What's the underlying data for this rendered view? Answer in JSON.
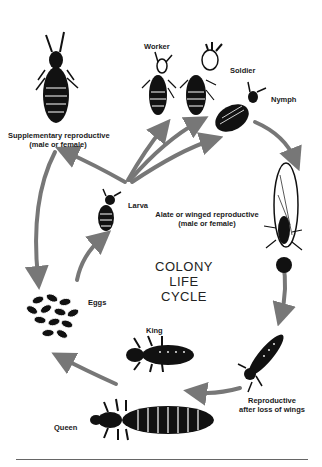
{
  "diagram": {
    "title_line1": "COLONY",
    "title_line2": "LIFE CYCLE",
    "arrow_color": "#777777",
    "ink_color": "#111111",
    "stages": {
      "supplementary": {
        "line1": "Supplementary reproductive",
        "line2": "(male or female)"
      },
      "worker": {
        "label": "Worker"
      },
      "soldier": {
        "label": "Soldier"
      },
      "nymph": {
        "label": "Nymph"
      },
      "larva": {
        "label": "Larva"
      },
      "alate": {
        "line1": "Alate or winged reproductive",
        "line2": "(male or female)"
      },
      "eggs": {
        "label": "Eggs"
      },
      "king": {
        "label": "King"
      },
      "reproductive": {
        "line1": "Reproductive",
        "line2": "after loss of wings"
      },
      "queen": {
        "label": "Queen"
      }
    }
  }
}
